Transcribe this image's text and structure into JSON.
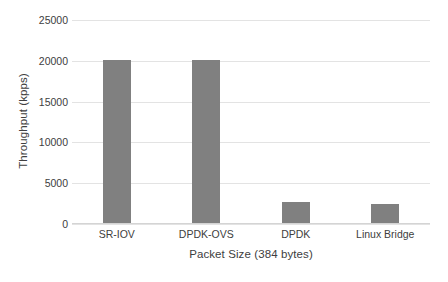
{
  "chart_data": {
    "type": "bar",
    "title": "",
    "subtitle": "",
    "categories": [
      "SR-IOV",
      "DPDK-OVS",
      "DPDK",
      "Linux Bridge"
    ],
    "values": [
      20000,
      20000,
      2550,
      2300
    ],
    "xlabel": "Packet Size (384 bytes)",
    "ylabel": "Throughput (kpps)",
    "ylim": [
      0,
      25000
    ],
    "ytick_labels": [
      "25000",
      "20000",
      "15000",
      "10000",
      "5000",
      "0"
    ],
    "ytick_values": [
      25000,
      20000,
      15000,
      10000,
      5000,
      0
    ],
    "grid": "horizontal",
    "legend": "none",
    "bar_color": "#808080",
    "gridline_color": "#e3e3e3",
    "text_color": "#404040",
    "background_color": "#ffffff"
  }
}
